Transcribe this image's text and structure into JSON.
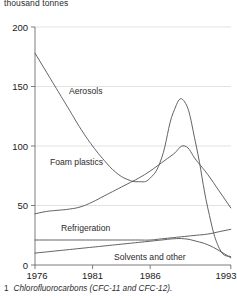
{
  "chart_data": {
    "type": "line",
    "title": "",
    "unit_label": "thousand tonnes",
    "xlabel": "",
    "ylabel": "thousand tonnes",
    "xlim": [
      1976,
      1993
    ],
    "ylim": [
      0,
      200
    ],
    "yticks": [
      0,
      50,
      100,
      150,
      200
    ],
    "xticks": [
      1976,
      1981,
      1986,
      1993
    ],
    "grid": true,
    "legend_position": "inline-labels",
    "x": [
      1976,
      1977,
      1978,
      1979,
      1980,
      1981,
      1982,
      1983,
      1984,
      1985,
      1986,
      1987,
      1988,
      1989,
      1990,
      1991,
      1992,
      1993
    ],
    "series": [
      {
        "name": "Aerosols",
        "values": [
          178,
          162,
          146,
          130,
          114,
          100,
          88,
          78,
          72,
          70,
          73,
          90,
          128,
          137,
          100,
          48,
          14,
          7
        ]
      },
      {
        "name": "Foam plastics",
        "values": [
          43,
          45,
          46,
          47,
          49,
          53,
          58,
          63,
          68,
          73,
          79,
          86,
          93,
          100,
          88,
          76,
          62,
          48
        ]
      },
      {
        "name": "Refrigeration",
        "values": [
          21,
          21,
          21,
          21,
          21,
          21,
          21,
          21,
          21,
          21,
          21,
          22,
          23,
          24,
          25,
          26,
          28,
          30
        ]
      },
      {
        "name": "Solvents and other",
        "values": [
          10,
          11,
          12,
          13,
          14,
          15,
          16,
          17,
          18,
          19,
          20,
          21,
          22,
          22,
          20,
          17,
          12,
          6
        ]
      }
    ],
    "annotations": [
      {
        "text": "Aerosols",
        "x": 1981.3,
        "y": 122
      },
      {
        "text": "Foam plastics",
        "x": 1980.2,
        "y": 64
      },
      {
        "text": "Refrigeration",
        "x": 1980.1,
        "y": 26
      },
      {
        "text": "Solvents and other",
        "x": 1986.6,
        "y": 7
      }
    ]
  },
  "footnote": {
    "marker": "1",
    "text": "Chlorofluorocarbons (CFC-11 and CFC-12)."
  },
  "ticks": {
    "y": [
      "0",
      "50",
      "100",
      "150",
      "200"
    ],
    "x": [
      "1976",
      "1981",
      "1986",
      "1993"
    ]
  },
  "labels": {
    "aerosols": "Aerosols",
    "foam_plastics": "Foam plastics",
    "refrigeration": "Refrigeration",
    "solvents_and_other": "Solvents and other"
  },
  "colors": {
    "line": "#5a5a5a",
    "grid": "#d6d6d6",
    "axis": "#6e6e6e",
    "text": "#1a1a1a",
    "background": "#ffffff"
  }
}
